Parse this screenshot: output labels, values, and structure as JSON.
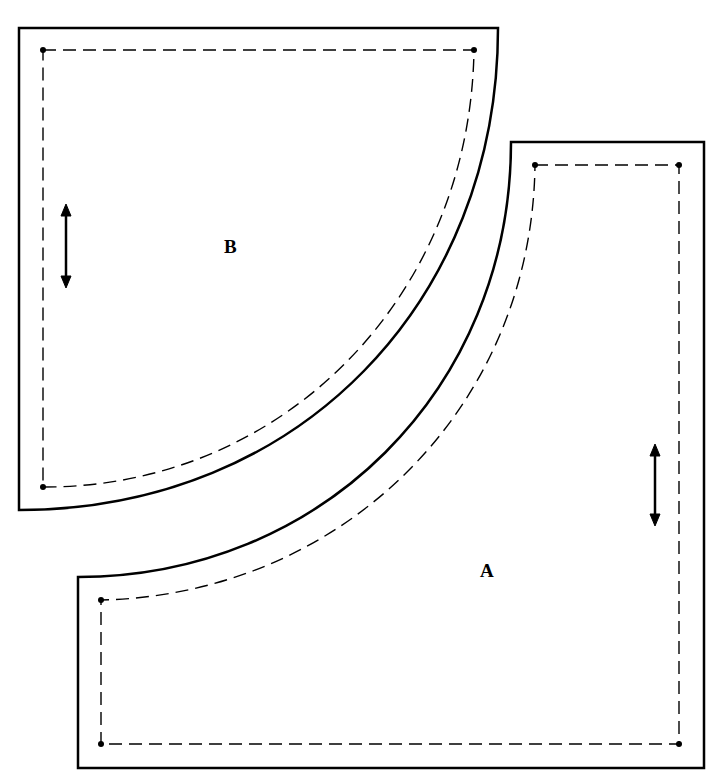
{
  "diagram": {
    "type": "quilt-pattern-templates",
    "pieces": [
      {
        "id": "B",
        "label": "B",
        "shape": "quarter-circle",
        "grain_arrow": "vertical"
      },
      {
        "id": "A",
        "label": "A",
        "shape": "square-with-concave-curve",
        "grain_arrow": "vertical"
      }
    ],
    "legend": {
      "solid_line": "cutting line",
      "dashed_line": "seam line",
      "dots": "seam corners"
    }
  }
}
